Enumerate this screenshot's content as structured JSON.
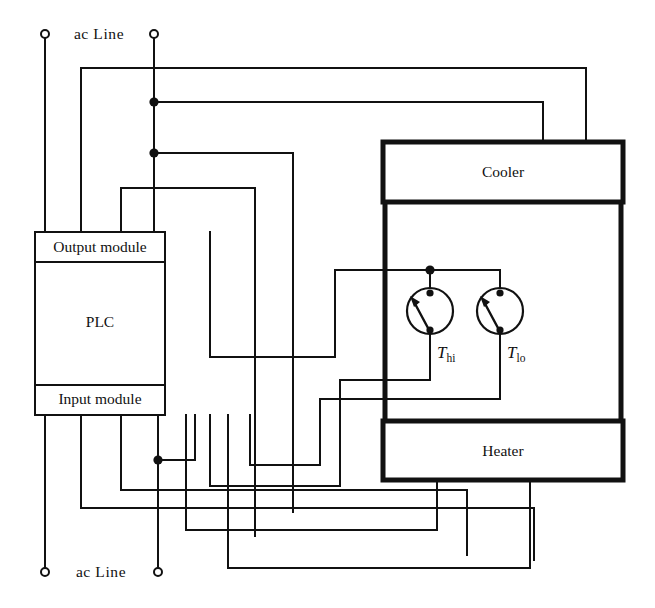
{
  "diagram": {
    "ac_line_top_label": "ac Line",
    "ac_line_bottom_label": "ac Line",
    "blocks": {
      "output_module": "Output module",
      "plc": "PLC",
      "input_module": "Input module",
      "cooler": "Cooler",
      "heater": "Heater"
    },
    "thermostats": [
      {
        "id": "t-hi",
        "symbol": "T",
        "subscript": "hi"
      },
      {
        "id": "t-lo",
        "symbol": "T",
        "subscript": "lo"
      }
    ],
    "colors": {
      "wire": "#111111",
      "background": "#ffffff",
      "fill": "#ffffff"
    }
  }
}
